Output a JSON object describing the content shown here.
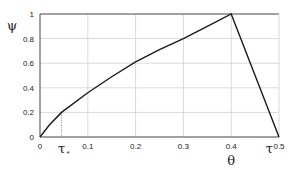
{
  "chart_data": {
    "type": "line",
    "title": "",
    "xlabel": "θ",
    "ylabel": "ψ",
    "xlim": [
      0,
      0.5
    ],
    "ylim": [
      0,
      1
    ],
    "grid": true,
    "x_ticks": [
      "0",
      "0.1",
      "0.2",
      "0.3",
      "0.4",
      "0.5"
    ],
    "y_ticks": [
      "0",
      "0.2",
      "0.4",
      "0.6",
      "0.8",
      "1"
    ],
    "annotations": [
      {
        "text": "τ*",
        "x": 0.045,
        "note": "dotted vertical marker"
      },
      {
        "text": "τ",
        "x": 0.48,
        "note": "label near x-axis end"
      }
    ],
    "series": [
      {
        "name": "ψ(θ)",
        "x": [
          0,
          0.02,
          0.045,
          0.1,
          0.15,
          0.2,
          0.25,
          0.3,
          0.35,
          0.4,
          0.45,
          0.5
        ],
        "y": [
          0,
          0.1,
          0.2,
          0.36,
          0.49,
          0.61,
          0.71,
          0.8,
          0.9,
          1.0,
          0.5,
          0.0
        ]
      }
    ]
  }
}
